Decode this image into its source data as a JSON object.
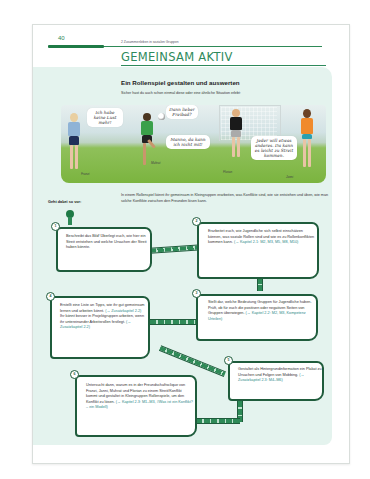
{
  "header": {
    "page_number": "40",
    "running_head": "2 Zusammenleben in sozialen Gruppen",
    "section_title": "GEMEINSAM AKTIV"
  },
  "activity": {
    "subtitle": "Ein Rollenspiel gestalten und auswerten",
    "intro": "Sicher hast du auch schon einmal diese oder eine ähnliche Situation erlebt:"
  },
  "illustration": {
    "characters": [
      {
        "name": "Franzi",
        "speech": "Ich habe keine Lust mehr!"
      },
      {
        "name": "Muhrat",
        "speech": "Dann lieber Freibad?"
      },
      {
        "name": "Florian",
        "speech": "Manno, da kann ich nicht mit!"
      },
      {
        "name": "Janni",
        "speech": "Jeder will etwas anderes. Da kann es leicht zu Streit kommen."
      }
    ]
  },
  "procedure": {
    "label": "Geht dabei so vor:",
    "intro": "In einem Rollenspiel könnt ihr gemeinsam in Kleingruppen erarbeiten, was Konflikte sind, wie sie entstehen und üben, wie man solche Konflikte zwischen den Freunden lösen kann.",
    "steps": [
      {
        "number": "1",
        "text": "Beschreibt das Bild! Überlegt euch, wie hier ein Streit entstehen und welche Ursachen der Streit haben könnte.",
        "ref": ""
      },
      {
        "number": "2",
        "text": "Erarbeitet euch, wie Jugendliche sich selbst einschätzen können, was soziale Rollen sind und wie es zu Rollenkonflikten kommen kann.",
        "ref": "(→ Kapitel 2.1: M2, M3, M5, M8, M10)"
      },
      {
        "number": "3",
        "text": "Stellt dar, welche Bedeutung Gruppen für Jugendliche haben. Prüft, ob für euch die positiven oder negativen Seiten von Gruppen überwiegen.",
        "ref": "(→ Kapitel 2.2: M2, M3, Kompetenz Urteilen)"
      },
      {
        "number": "4",
        "text": "Erstellt eine Liste an Tipps, wie ihr gut gemeinsam lernen und arbeiten könnt.",
        "ref": "(→ Zusatzkapitel 2.2)",
        "text2": "Ihr könnt besser in Projektgruppen arbeiten, wenn ihr untereinander Arbeitsrollen festlegt.",
        "ref2": "(→ Zusatzkapitel 2.2)"
      },
      {
        "number": "5",
        "text": "Gestaltet als Hintergrundinformation ein Plakat zu Ursachen und Folgen von Mobbing.",
        "ref": "(→ Zusatzkapitel 2.3: M4–M6)"
      },
      {
        "number": "6",
        "text": "Untersucht dann, warum es in der Freundschaftsclique von Franzi, Janni, Muhrat und Florian zu einem Streit/Konflikt kommt und gestaltet in Kleingruppen Rollenspiele, um den Konflikt zu lösen.",
        "ref": "(→ Kapitel 2.3: M1–M3, #Was ist ein Konflikt? – ein Modell)"
      }
    ]
  },
  "colors": {
    "accent_green": "#2e8a57",
    "dark_green": "#1f5c3c",
    "panel_mint": "#e4f3ee",
    "reference_teal": "#2e8a8a"
  }
}
